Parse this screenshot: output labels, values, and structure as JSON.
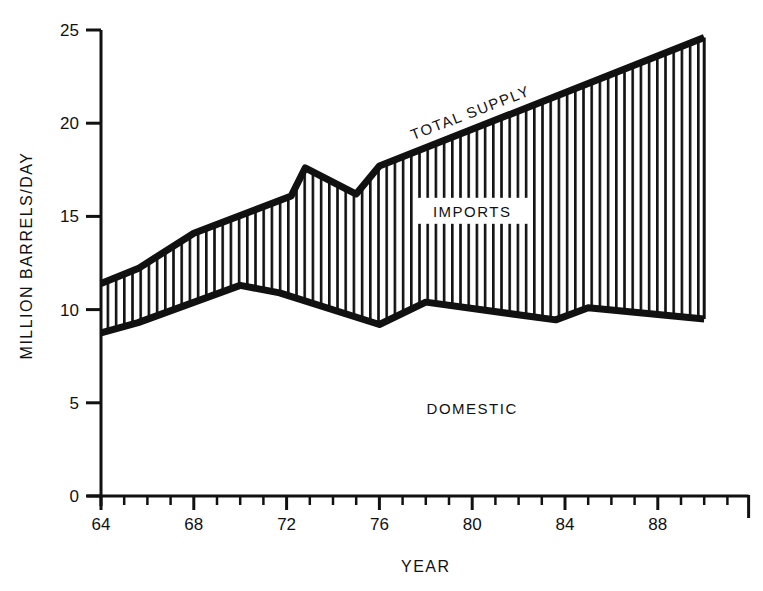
{
  "chart_data": {
    "type": "area",
    "title": "",
    "xlabel": "YEAR",
    "ylabel": "MILLION BARRELS/DAY",
    "xlim": [
      64,
      92
    ],
    "ylim": [
      0,
      25
    ],
    "x_ticks": [
      64,
      68,
      72,
      76,
      80,
      84,
      88
    ],
    "x_tick_labels": [
      "64",
      "68",
      "72",
      "76",
      "80",
      "84",
      "88"
    ],
    "y_ticks": [
      0,
      5,
      10,
      15,
      20,
      25
    ],
    "y_tick_labels": [
      "0",
      "5",
      "10",
      "15",
      "20",
      "25"
    ],
    "grid": false,
    "legend": null,
    "series": [
      {
        "name": "TOTAL SUPPLY",
        "points": [
          [
            64,
            11.4
          ],
          [
            65.6,
            12.2
          ],
          [
            68,
            14.1
          ],
          [
            72.2,
            16.1
          ],
          [
            72.8,
            17.6
          ],
          [
            75,
            16.2
          ],
          [
            76,
            17.7
          ],
          [
            90,
            24.6
          ]
        ]
      },
      {
        "name": "DOMESTIC",
        "points": [
          [
            64,
            8.75
          ],
          [
            65.6,
            9.3
          ],
          [
            70,
            11.3
          ],
          [
            71.7,
            10.9
          ],
          [
            76,
            9.2
          ],
          [
            78,
            10.4
          ],
          [
            83.6,
            9.45
          ],
          [
            85,
            10.1
          ],
          [
            90,
            9.5
          ]
        ]
      }
    ],
    "regions": [
      {
        "name": "IMPORTS",
        "fill": "vertical hatch",
        "between": [
          "DOMESTIC",
          "TOTAL SUPPLY"
        ]
      },
      {
        "name": "DOMESTIC",
        "fill": "none",
        "between": [
          "x-axis",
          "DOMESTIC"
        ]
      }
    ],
    "annotations": [
      {
        "text": "TOTAL SUPPLY",
        "x": 80,
        "y": 20.3,
        "rotation": -21
      },
      {
        "text": "IMPORTS",
        "x": 80,
        "y": 15.3
      },
      {
        "text": "DOMESTIC",
        "x": 80,
        "y": 4.7
      }
    ]
  },
  "labels": {
    "xlabel": "YEAR",
    "ylabel": "MILLION BARRELS/DAY",
    "total_supply": "TOTAL SUPPLY",
    "imports": "IMPORTS",
    "domestic": "DOMESTIC"
  },
  "colors": {
    "ink": "#111111",
    "background": "#ffffff"
  }
}
